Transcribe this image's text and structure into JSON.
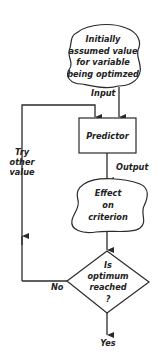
{
  "diagram": {
    "type": "flowchart",
    "nodes": {
      "start": {
        "lines": [
          "Initially",
          "assumed value",
          "for variable",
          "being optimzed"
        ]
      },
      "predictor": {
        "label": "Predictor"
      },
      "effect": {
        "lines": [
          "Effect",
          "on",
          "criterion"
        ]
      },
      "decision": {
        "lines": [
          "Is",
          "optimum",
          "reached",
          "?"
        ]
      }
    },
    "edges": {
      "input": "Input",
      "output": "Output",
      "no": "No",
      "yes": "Yes",
      "loop": [
        "Try",
        "other",
        "value"
      ]
    }
  }
}
